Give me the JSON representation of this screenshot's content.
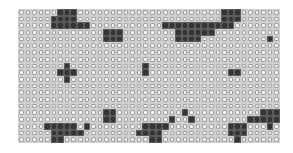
{
  "board": {
    "cols": 40,
    "rows": 20,
    "colors": {
      "empty_fill": "#ffffff",
      "empty_stroke": "#9a9a9a",
      "filled": "#3a3a3a",
      "grid": "#cfcfcf"
    },
    "filled_cells": [
      [
        0,
        6
      ],
      [
        0,
        7
      ],
      [
        0,
        8
      ],
      [
        1,
        5
      ],
      [
        1,
        6
      ],
      [
        1,
        7
      ],
      [
        1,
        8
      ],
      [
        2,
        5
      ],
      [
        2,
        6
      ],
      [
        2,
        7
      ],
      [
        2,
        8
      ],
      [
        2,
        9
      ],
      [
        2,
        10
      ],
      [
        3,
        13
      ],
      [
        3,
        14
      ],
      [
        3,
        15
      ],
      [
        4,
        13
      ],
      [
        4,
        14
      ],
      [
        4,
        15
      ],
      [
        0,
        31
      ],
      [
        0,
        32
      ],
      [
        0,
        33
      ],
      [
        1,
        31
      ],
      [
        1,
        32
      ],
      [
        1,
        33
      ],
      [
        2,
        22
      ],
      [
        2,
        23
      ],
      [
        2,
        24
      ],
      [
        2,
        25
      ],
      [
        2,
        26
      ],
      [
        2,
        27
      ],
      [
        2,
        28
      ],
      [
        2,
        29
      ],
      [
        2,
        30
      ],
      [
        2,
        31
      ],
      [
        2,
        32
      ],
      [
        3,
        24
      ],
      [
        3,
        25
      ],
      [
        3,
        26
      ],
      [
        3,
        27
      ],
      [
        3,
        28
      ],
      [
        3,
        29
      ],
      [
        4,
        24
      ],
      [
        4,
        25
      ],
      [
        4,
        26
      ],
      [
        4,
        27
      ],
      [
        4,
        38
      ],
      [
        8,
        7
      ],
      [
        9,
        6
      ],
      [
        9,
        7
      ],
      [
        9,
        8
      ],
      [
        10,
        7
      ],
      [
        8,
        19
      ],
      [
        9,
        19
      ],
      [
        9,
        32
      ],
      [
        9,
        33
      ],
      [
        15,
        13
      ],
      [
        15,
        14
      ],
      [
        16,
        13
      ],
      [
        16,
        14
      ],
      [
        17,
        4
      ],
      [
        17,
        5
      ],
      [
        17,
        6
      ],
      [
        17,
        7
      ],
      [
        17,
        8
      ],
      [
        17,
        10
      ],
      [
        18,
        5
      ],
      [
        18,
        6
      ],
      [
        18,
        7
      ],
      [
        18,
        8
      ],
      [
        18,
        9
      ],
      [
        19,
        5
      ],
      [
        19,
        6
      ],
      [
        17,
        19
      ],
      [
        17,
        20
      ],
      [
        17,
        21
      ],
      [
        17,
        22
      ],
      [
        18,
        18
      ],
      [
        18,
        19
      ],
      [
        18,
        20
      ],
      [
        18,
        21
      ],
      [
        19,
        20
      ],
      [
        19,
        21
      ],
      [
        16,
        23
      ],
      [
        15,
        25
      ],
      [
        16,
        26
      ],
      [
        15,
        37
      ],
      [
        15,
        38
      ],
      [
        15,
        39
      ],
      [
        16,
        35
      ],
      [
        16,
        36
      ],
      [
        16,
        37
      ],
      [
        16,
        38
      ],
      [
        16,
        39
      ],
      [
        17,
        32
      ],
      [
        17,
        33
      ],
      [
        17,
        34
      ],
      [
        17,
        38
      ],
      [
        18,
        32
      ],
      [
        18,
        33
      ],
      [
        18,
        34
      ],
      [
        19,
        33
      ]
    ]
  }
}
